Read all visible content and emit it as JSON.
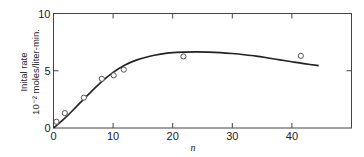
{
  "chart_data": {
    "type": "scatter",
    "title": "",
    "xlabel": "n",
    "ylabel": "Inital rate",
    "ylabel_units": "10⁻² moles/liter-min.",
    "xlim": [
      0,
      50
    ],
    "ylim": [
      0,
      10
    ],
    "x_ticks": [
      0,
      10,
      20,
      30,
      40
    ],
    "x_tick_labels": [
      "0",
      "10",
      "20",
      "30",
      "40"
    ],
    "y_ticks": [
      0,
      5,
      10
    ],
    "y_tick_labels": [
      "0",
      "5",
      "10"
    ],
    "grid": false,
    "legend": null,
    "series": [
      {
        "name": "observed",
        "kind": "markers",
        "marker": "open-circle",
        "x": [
          0.5,
          1.9,
          5.1,
          8.1,
          10.1,
          11.8,
          21.8,
          41.5
        ],
        "y": [
          0.55,
          1.3,
          2.65,
          4.3,
          4.6,
          5.1,
          6.25,
          6.3
        ]
      },
      {
        "name": "fitted curve",
        "kind": "line",
        "x": [
          0,
          2,
          4,
          6,
          8,
          10,
          12,
          14,
          16,
          18,
          20,
          22,
          24,
          26,
          28,
          30,
          32,
          34,
          36,
          38,
          40,
          42,
          44.5
        ],
        "y": [
          0,
          0.9,
          1.95,
          3.0,
          4.0,
          4.85,
          5.5,
          5.95,
          6.25,
          6.45,
          6.58,
          6.63,
          6.65,
          6.63,
          6.58,
          6.5,
          6.4,
          6.28,
          6.12,
          5.95,
          5.78,
          5.62,
          5.45
        ]
      }
    ]
  },
  "colors": {
    "axis": "#444444",
    "curve": "#222222",
    "marker": "#555555"
  }
}
